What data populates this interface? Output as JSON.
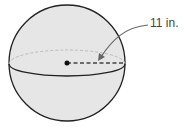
{
  "figure": {
    "shape": "sphere",
    "radius_label": "11 in.",
    "colors": {
      "fill": "#e6e6e6",
      "stroke": "#222222",
      "hidden": "#bbbbbb",
      "arrow": "#666666"
    }
  }
}
